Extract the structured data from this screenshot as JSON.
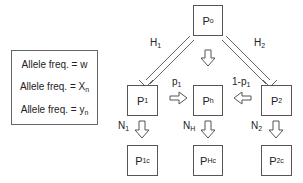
{
  "legend": {
    "rows": [
      {
        "text": "Allele freq. = ",
        "var": "w",
        "sub": ""
      },
      {
        "text": "Allele freq. = ",
        "var": "X",
        "sub": "n"
      },
      {
        "text": "Allele freq. = ",
        "var": "y",
        "sub": "n"
      }
    ]
  },
  "nodes": {
    "p0": {
      "main": "P",
      "sub": "o"
    },
    "p1": {
      "main": "P",
      "sub": "1"
    },
    "ph": {
      "main": "P",
      "sub": "h"
    },
    "p2": {
      "main": "P",
      "sub": "2"
    },
    "p1c": {
      "main": "P",
      "sub": "1c"
    },
    "phc": {
      "main": "P",
      "sub": "Hc"
    },
    "p2c": {
      "main": "P",
      "sub": "2c"
    }
  },
  "edge_labels": {
    "h1": {
      "main": "H",
      "sub": "1"
    },
    "h2": {
      "main": "H",
      "sub": "2"
    },
    "p1": {
      "main": "p",
      "sub": "1"
    },
    "one_minus_p1": {
      "main": "1-p",
      "sub": "1"
    },
    "n1": {
      "main": "N",
      "sub": "1"
    },
    "nh": {
      "main": "N",
      "sub": "H"
    },
    "n2": {
      "main": "N",
      "sub": "2"
    }
  }
}
